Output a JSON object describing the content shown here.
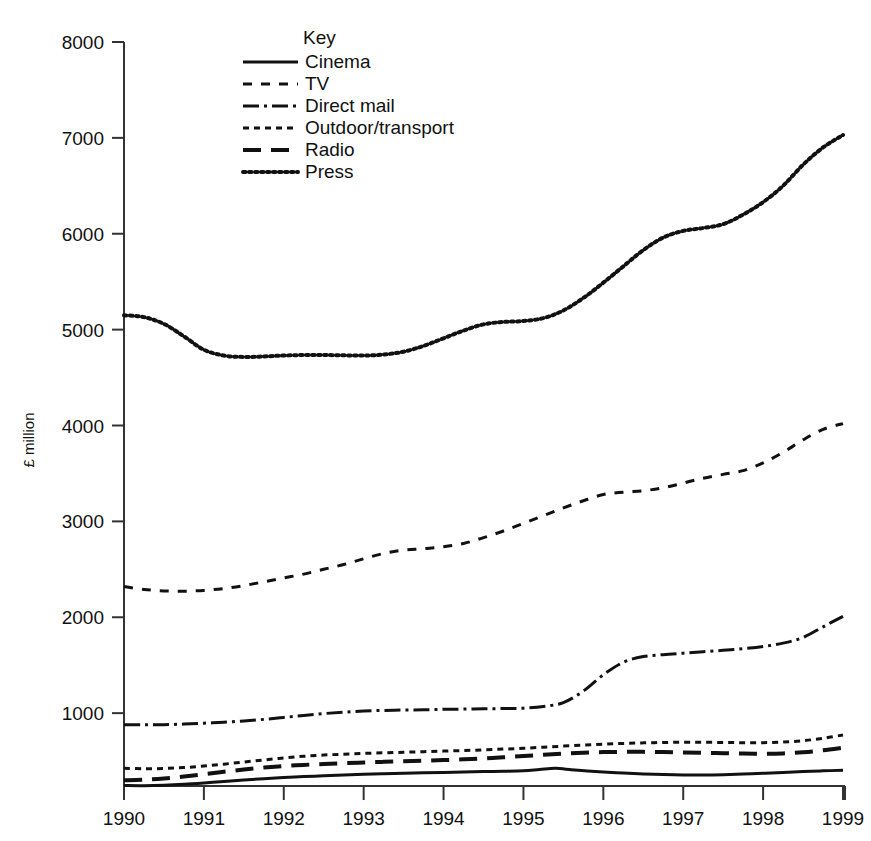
{
  "chart_data": {
    "type": "line",
    "title": "",
    "xlabel": "",
    "ylabel": "£ million",
    "xlim": [
      1990,
      1999
    ],
    "ylim": [
      240,
      8000
    ],
    "grid": false,
    "legend_position": "top-center",
    "legend_title": "Key",
    "y_ticks": [
      1000,
      2000,
      3000,
      4000,
      5000,
      6000,
      7000,
      8000
    ],
    "y_tick_labels": [
      "1000",
      "2000",
      "3000",
      "4000",
      "5000",
      "6000",
      "7000",
      "8000"
    ],
    "x_ticks": [
      1990,
      1991,
      1992,
      1993,
      1994,
      1995,
      1996,
      1997,
      1998,
      1999
    ],
    "x_tick_labels": [
      "1990",
      "1991",
      "1992",
      "1993",
      "1994",
      "1995",
      "1996",
      "1997",
      "1998",
      "1999"
    ],
    "series": [
      {
        "name": "Cinema",
        "dash": "none",
        "stroke_width": 3,
        "x": [
          1990,
          1990.25,
          1990.5,
          1990.75,
          1991,
          1991.25,
          1991.5,
          1991.75,
          1992,
          1992.25,
          1992.5,
          1992.75,
          1993,
          1993.25,
          1993.5,
          1993.75,
          1994,
          1994.25,
          1994.5,
          1994.75,
          1995,
          1995.2,
          1995.4,
          1995.6,
          1995.8,
          1996,
          1996.25,
          1996.5,
          1996.75,
          1997,
          1997.25,
          1997.5,
          1997.75,
          1998,
          1998.25,
          1998.5,
          1998.75,
          1999
        ],
        "y": [
          245,
          243,
          248,
          258,
          272,
          288,
          303,
          316,
          328,
          338,
          347,
          355,
          362,
          368,
          373,
          378,
          382,
          386,
          390,
          394,
          400,
          412,
          424,
          410,
          396,
          385,
          375,
          366,
          360,
          356,
          355,
          358,
          364,
          372,
          381,
          390,
          398,
          404
        ]
      },
      {
        "name": "TV",
        "dash": "dash-gap",
        "stroke_width": 3,
        "x": [
          1990,
          1990.25,
          1990.5,
          1990.75,
          1991,
          1991.25,
          1991.5,
          1991.75,
          1992,
          1992.25,
          1992.5,
          1992.75,
          1993,
          1993.25,
          1993.5,
          1993.75,
          1994,
          1994.25,
          1994.5,
          1994.75,
          1995,
          1995.25,
          1995.5,
          1995.75,
          1996,
          1996.25,
          1996.5,
          1996.75,
          1997,
          1997.25,
          1997.5,
          1997.75,
          1998,
          1998.25,
          1998.5,
          1998.75,
          1999
        ],
        "y": [
          2320,
          2290,
          2275,
          2272,
          2280,
          2300,
          2330,
          2370,
          2410,
          2450,
          2500,
          2550,
          2610,
          2665,
          2700,
          2715,
          2735,
          2770,
          2830,
          2900,
          2980,
          3060,
          3140,
          3215,
          3280,
          3305,
          3320,
          3350,
          3400,
          3450,
          3490,
          3530,
          3610,
          3720,
          3850,
          3960,
          4020
        ]
      },
      {
        "name": "Direct mail",
        "dash": "dash-dot",
        "stroke_width": 3,
        "x": [
          1990,
          1990.25,
          1990.5,
          1990.75,
          1991,
          1991.25,
          1991.5,
          1991.75,
          1992,
          1992.25,
          1992.5,
          1992.75,
          1993,
          1993.25,
          1993.5,
          1993.75,
          1994,
          1994.25,
          1994.5,
          1994.75,
          1995,
          1995.25,
          1995.5,
          1995.75,
          1996,
          1996.25,
          1996.5,
          1996.75,
          1997,
          1997.25,
          1997.5,
          1997.75,
          1998,
          1998.25,
          1998.5,
          1998.75,
          1999
        ],
        "y": [
          880,
          878,
          880,
          886,
          895,
          905,
          918,
          935,
          955,
          975,
          995,
          1010,
          1022,
          1028,
          1032,
          1035,
          1040,
          1042,
          1045,
          1048,
          1052,
          1070,
          1110,
          1230,
          1400,
          1530,
          1590,
          1610,
          1625,
          1640,
          1655,
          1672,
          1695,
          1730,
          1790,
          1900,
          2010
        ]
      },
      {
        "name": "Outdoor/transport",
        "dash": "fine-dash",
        "stroke_width": 3,
        "x": [
          1990,
          1990.25,
          1990.5,
          1990.75,
          1991,
          1991.25,
          1991.5,
          1991.75,
          1992,
          1992.25,
          1992.5,
          1992.75,
          1993,
          1993.25,
          1993.5,
          1993.75,
          1994,
          1994.25,
          1994.5,
          1994.75,
          1995,
          1995.25,
          1995.5,
          1995.75,
          1996,
          1996.25,
          1996.5,
          1996.75,
          1997,
          1997.25,
          1997.5,
          1997.75,
          1998,
          1998.25,
          1998.5,
          1998.75,
          1999
        ],
        "y": [
          425,
          420,
          423,
          432,
          448,
          468,
          490,
          512,
          532,
          550,
          563,
          572,
          580,
          586,
          592,
          598,
          604,
          610,
          617,
          625,
          634,
          645,
          656,
          666,
          676,
          684,
          690,
          694,
          696,
          696,
          694,
          692,
          692,
          698,
          712,
          738,
          772
        ]
      },
      {
        "name": "Radio",
        "dash": "long-dash",
        "stroke_width": 4,
        "x": [
          1990,
          1990.25,
          1990.5,
          1990.75,
          1991,
          1991.25,
          1991.5,
          1991.75,
          1992,
          1992.25,
          1992.5,
          1992.75,
          1993,
          1993.25,
          1993.5,
          1993.75,
          1994,
          1994.25,
          1994.5,
          1994.75,
          1995,
          1995.25,
          1995.5,
          1995.75,
          1996,
          1996.25,
          1996.5,
          1996.75,
          1997,
          1997.25,
          1997.5,
          1997.75,
          1998,
          1998.25,
          1998.5,
          1998.75,
          1999
        ],
        "y": [
          300,
          305,
          318,
          338,
          362,
          388,
          412,
          432,
          448,
          460,
          470,
          478,
          485,
          492,
          498,
          504,
          510,
          518,
          528,
          540,
          552,
          566,
          578,
          588,
          594,
          596,
          596,
          594,
          590,
          586,
          582,
          578,
          576,
          580,
          592,
          612,
          640
        ]
      },
      {
        "name": "Press",
        "dash": "dot",
        "stroke_width": 4,
        "x": [
          1990,
          1990.25,
          1990.5,
          1990.75,
          1991,
          1991.25,
          1991.5,
          1991.75,
          1992,
          1992.25,
          1992.5,
          1992.75,
          1993,
          1993.25,
          1993.5,
          1993.75,
          1994,
          1994.25,
          1994.5,
          1994.75,
          1995,
          1995.25,
          1995.5,
          1995.75,
          1996,
          1996.25,
          1996.5,
          1996.75,
          1997,
          1997.25,
          1997.5,
          1997.75,
          1998,
          1998.25,
          1998.5,
          1998.75,
          1999
        ],
        "y": [
          5150,
          5130,
          5060,
          4930,
          4790,
          4730,
          4715,
          4720,
          4730,
          4735,
          4735,
          4732,
          4730,
          4740,
          4770,
          4830,
          4910,
          4990,
          5055,
          5080,
          5090,
          5120,
          5200,
          5330,
          5490,
          5660,
          5830,
          5960,
          6030,
          6060,
          6100,
          6200,
          6330,
          6500,
          6720,
          6900,
          7030
        ]
      }
    ]
  },
  "legend": {
    "title": "Key",
    "items": [
      {
        "label": "Cinema",
        "swatch": "solid-line-swatch"
      },
      {
        "label": "TV",
        "swatch": "dashed-line-swatch"
      },
      {
        "label": "Direct mail",
        "swatch": "dash-dot-line-swatch"
      },
      {
        "label": "Outdoor/transport",
        "swatch": "dotted-line-swatch"
      },
      {
        "label": "Radio",
        "swatch": "long-dash-line-swatch"
      },
      {
        "label": "Press",
        "swatch": "fine-dotted-line-swatch"
      }
    ]
  },
  "colors": {
    "background": "#ffffff",
    "ink": "#111111",
    "axis": "#333333"
  }
}
